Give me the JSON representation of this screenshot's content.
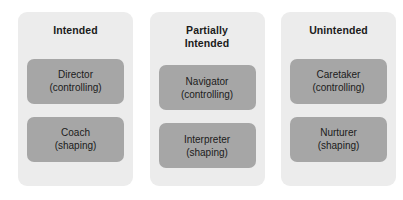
{
  "diagram": {
    "colors": {
      "panel_background": "#ececec",
      "box_fill": "#a6a6a6",
      "text": "#1b1b1b",
      "page_background": "#ffffff"
    },
    "columns": [
      {
        "header": "Intended",
        "boxes": [
          {
            "name": "Director",
            "mode": "(controlling)"
          },
          {
            "name": "Coach",
            "mode": "(shaping)"
          }
        ]
      },
      {
        "header": "Partially\nIntended",
        "boxes": [
          {
            "name": "Navigator",
            "mode": "(controlling)"
          },
          {
            "name": "Interpreter",
            "mode": "(shaping)"
          }
        ]
      },
      {
        "header": "Unintended",
        "boxes": [
          {
            "name": "Caretaker",
            "mode": "(controlling)"
          },
          {
            "name": "Nurturer",
            "mode": "(shaping)"
          }
        ]
      }
    ]
  }
}
